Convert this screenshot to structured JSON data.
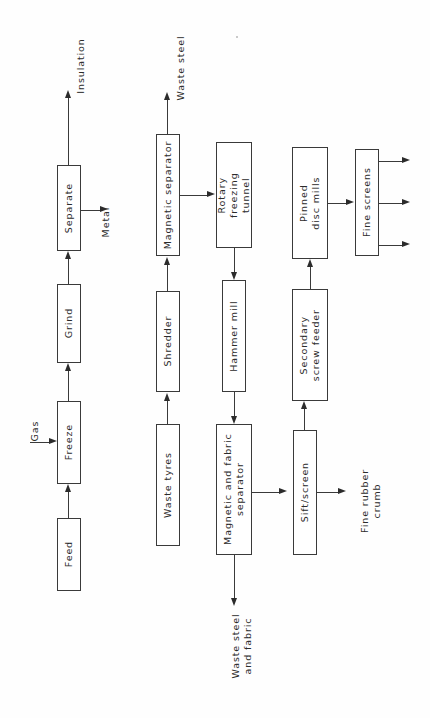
{
  "diagram": {
    "orientation": "text rotated 90 degrees counter-clockwise",
    "background_color": "#fefefe",
    "line_color": "#3a3a3a",
    "text_color": "#2b2b2b"
  },
  "rows": {
    "row1_name": "Cryogenic scrap line",
    "row2_name": "Waste tyre crumb line"
  },
  "boxes": [
    {
      "id": "feed",
      "label": "Feed",
      "x": 57,
      "y": 518,
      "w": 24,
      "h": 73
    },
    {
      "id": "freeze",
      "label": "Freeze",
      "x": 57,
      "y": 401,
      "w": 24,
      "h": 83
    },
    {
      "id": "grind",
      "label": "Grind",
      "x": 57,
      "y": 284,
      "w": 24,
      "h": 79
    },
    {
      "id": "separate",
      "label": "Separate",
      "x": 57,
      "y": 165,
      "w": 24,
      "h": 86
    },
    {
      "id": "waste-tyres",
      "label": "Waste tyres",
      "x": 156,
      "y": 424,
      "w": 24,
      "h": 122
    },
    {
      "id": "shredder",
      "label": "Shredder",
      "x": 156,
      "y": 291,
      "w": 24,
      "h": 101
    },
    {
      "id": "magnetic-separator",
      "label": "Magnetic separator",
      "x": 156,
      "y": 134,
      "w": 24,
      "h": 122
    },
    {
      "id": "magnetic-fabric-separator",
      "label": "Magnetic and fabric\nseparator",
      "x": 216,
      "y": 424,
      "w": 36,
      "h": 131
    },
    {
      "id": "hammer-mill",
      "label": "Hammer mill",
      "x": 222,
      "y": 280,
      "w": 24,
      "h": 112
    },
    {
      "id": "rotary-freezing-tunnel",
      "label": "Rotary\nfreezing\ntunnel",
      "x": 216,
      "y": 142,
      "w": 36,
      "h": 106
    },
    {
      "id": "sift-screen",
      "label": "Sift/screen",
      "x": 293,
      "y": 430,
      "w": 24,
      "h": 125
    },
    {
      "id": "secondary-screw-feeder",
      "label": "Secondary\nscrew feeder",
      "x": 292,
      "y": 289,
      "w": 36,
      "h": 112
    },
    {
      "id": "pinned-disc-mills",
      "label": "Pinned\ndisc mills",
      "x": 292,
      "y": 147,
      "w": 36,
      "h": 112
    },
    {
      "id": "fine-screens",
      "label": "Fine screens",
      "x": 355,
      "y": 149,
      "w": 24,
      "h": 107
    }
  ],
  "flow_labels": [
    {
      "id": "gas",
      "label": "Gas",
      "x": 18,
      "y": 425,
      "w": 34,
      "h": 12
    },
    {
      "id": "insulation",
      "label": "Insulation",
      "x": 50,
      "y": 60,
      "w": 62,
      "h": 12
    },
    {
      "id": "metal",
      "label": "Metal",
      "x": 86,
      "y": 216,
      "w": 40,
      "h": 12
    },
    {
      "id": "waste-steel",
      "label": "Waste steel",
      "x": 146,
      "y": 62,
      "w": 70,
      "h": 12
    },
    {
      "id": "waste-steel-and-fabric",
      "label": "Waste steel\nand fabric",
      "x": 206,
      "y": 634,
      "w": 72,
      "h": 24
    },
    {
      "id": "fine-rubber-crumb",
      "label": "Fine rubber\ncrumb",
      "x": 335,
      "y": 489,
      "w": 72,
      "h": 24
    }
  ],
  "connections": [
    {
      "from": "feed",
      "to": "freeze",
      "kind": "vertical-up"
    },
    {
      "from": "gas",
      "to": "freeze",
      "kind": "horizontal-right"
    },
    {
      "from": "freeze",
      "to": "grind",
      "kind": "vertical-up"
    },
    {
      "from": "grind",
      "to": "separate",
      "kind": "vertical-up"
    },
    {
      "from": "separate",
      "to": "insulation",
      "kind": "vertical-up"
    },
    {
      "from": "separate",
      "to": "metal",
      "kind": "horizontal-right"
    },
    {
      "from": "waste-tyres",
      "to": "shredder",
      "kind": "vertical-up"
    },
    {
      "from": "shredder",
      "to": "magnetic-separator",
      "kind": "vertical-up"
    },
    {
      "from": "magnetic-separator",
      "to": "waste-steel",
      "kind": "vertical-up"
    },
    {
      "from": "magnetic-separator",
      "to": "rotary-freezing-tunnel",
      "kind": "horizontal-right"
    },
    {
      "from": "rotary-freezing-tunnel",
      "to": "hammer-mill",
      "kind": "vertical-down"
    },
    {
      "from": "hammer-mill",
      "to": "magnetic-fabric-separator",
      "kind": "vertical-down"
    },
    {
      "from": "magnetic-fabric-separator",
      "to": "waste-steel-and-fabric",
      "kind": "vertical-down"
    },
    {
      "from": "magnetic-fabric-separator",
      "to": "sift-screen",
      "kind": "horizontal-right"
    },
    {
      "from": "sift-screen",
      "to": "fine-rubber-crumb",
      "kind": "horizontal-right"
    },
    {
      "from": "sift-screen",
      "to": "secondary-screw-feeder",
      "kind": "vertical-up"
    },
    {
      "from": "secondary-screw-feeder",
      "to": "pinned-disc-mills",
      "kind": "vertical-up"
    },
    {
      "from": "pinned-disc-mills",
      "to": "fine-screens",
      "kind": "horizontal-right"
    },
    {
      "from": "fine-screens",
      "to": "product-outlet-1",
      "kind": "horizontal-right"
    },
    {
      "from": "fine-screens",
      "to": "product-outlet-2",
      "kind": "horizontal-right"
    },
    {
      "from": "fine-screens",
      "to": "product-outlet-3",
      "kind": "horizontal-right"
    }
  ]
}
